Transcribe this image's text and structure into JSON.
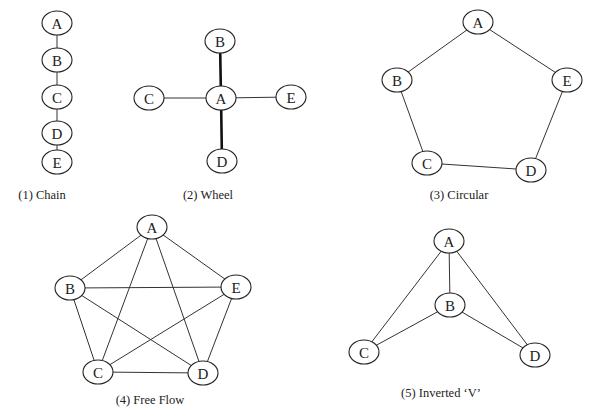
{
  "diagrams": [
    {
      "id": "chain",
      "caption": "(1) Chain",
      "caption_pos": [
        42,
        199
      ],
      "nodes": [
        {
          "label": "A",
          "x": 57,
          "y": 23
        },
        {
          "label": "B",
          "x": 57,
          "y": 60
        },
        {
          "label": "C",
          "x": 57,
          "y": 97
        },
        {
          "label": "D",
          "x": 57,
          "y": 133
        },
        {
          "label": "E",
          "x": 57,
          "y": 162
        }
      ],
      "edges": [
        [
          "A",
          "B"
        ],
        [
          "B",
          "C"
        ],
        [
          "C",
          "D"
        ],
        [
          "D",
          "E"
        ]
      ],
      "thick_edges": []
    },
    {
      "id": "wheel",
      "caption": "(2) Wheel",
      "caption_pos": [
        208,
        199
      ],
      "nodes": [
        {
          "label": "B",
          "x": 220,
          "y": 41
        },
        {
          "label": "C",
          "x": 149,
          "y": 98
        },
        {
          "label": "A",
          "x": 221,
          "y": 98
        },
        {
          "label": "E",
          "x": 291,
          "y": 97
        },
        {
          "label": "D",
          "x": 222,
          "y": 161
        }
      ],
      "edges": [
        [
          "A",
          "C"
        ],
        [
          "A",
          "E"
        ]
      ],
      "thick_edges": [
        [
          "A",
          "B"
        ],
        [
          "A",
          "D"
        ]
      ]
    },
    {
      "id": "circular",
      "caption": "(3) Circular",
      "caption_pos": [
        459,
        199
      ],
      "nodes": [
        {
          "label": "A",
          "x": 478,
          "y": 22
        },
        {
          "label": "B",
          "x": 397,
          "y": 80
        },
        {
          "label": "E",
          "x": 567,
          "y": 80
        },
        {
          "label": "C",
          "x": 427,
          "y": 163
        },
        {
          "label": "D",
          "x": 531,
          "y": 170
        }
      ],
      "edges": [
        [
          "A",
          "B"
        ],
        [
          "A",
          "E"
        ],
        [
          "B",
          "C"
        ],
        [
          "C",
          "D"
        ],
        [
          "D",
          "E"
        ]
      ],
      "thick_edges": []
    },
    {
      "id": "free-flow",
      "caption": "(4) Free Flow",
      "caption_pos": [
        150,
        404
      ],
      "nodes": [
        {
          "label": "A",
          "x": 152,
          "y": 227
        },
        {
          "label": "B",
          "x": 70,
          "y": 288
        },
        {
          "label": "E",
          "x": 236,
          "y": 287
        },
        {
          "label": "C",
          "x": 98,
          "y": 372
        },
        {
          "label": "D",
          "x": 203,
          "y": 373
        }
      ],
      "edges": [
        [
          "A",
          "B"
        ],
        [
          "A",
          "E"
        ],
        [
          "A",
          "C"
        ],
        [
          "A",
          "D"
        ],
        [
          "B",
          "E"
        ],
        [
          "B",
          "C"
        ],
        [
          "B",
          "D"
        ],
        [
          "C",
          "D"
        ],
        [
          "C",
          "E"
        ],
        [
          "D",
          "E"
        ]
      ],
      "thick_edges": []
    },
    {
      "id": "inverted-v",
      "caption": "(5) Inverted ‘V’",
      "caption_pos": [
        441,
        397
      ],
      "nodes": [
        {
          "label": "A",
          "x": 449,
          "y": 241
        },
        {
          "label": "B",
          "x": 450,
          "y": 305
        },
        {
          "label": "C",
          "x": 364,
          "y": 352
        },
        {
          "label": "D",
          "x": 535,
          "y": 355
        }
      ],
      "edges": [
        [
          "A",
          "B"
        ],
        [
          "A",
          "C"
        ],
        [
          "A",
          "D"
        ],
        [
          "B",
          "C"
        ],
        [
          "B",
          "D"
        ]
      ],
      "thick_edges": []
    }
  ],
  "node_style": {
    "rx": 15,
    "ry": 12
  }
}
